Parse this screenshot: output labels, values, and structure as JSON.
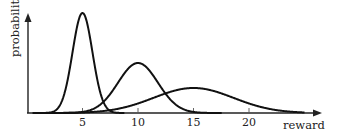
{
  "chart_data": {
    "type": "line",
    "title": "",
    "xlabel": "reward",
    "ylabel": "probability",
    "xticks": [
      5,
      10,
      15,
      20
    ],
    "xlim": [
      0,
      26
    ],
    "ylim": [
      0,
      1
    ],
    "grid": false,
    "legend": null,
    "series": [
      {
        "name": "distribution-1",
        "mean": 5,
        "sd": 0.9,
        "peak": 1.0
      },
      {
        "name": "distribution-2",
        "mean": 10,
        "sd": 1.8,
        "peak": 0.5
      },
      {
        "name": "distribution-3",
        "mean": 15,
        "sd": 3.6,
        "peak": 0.25
      }
    ]
  },
  "labels": {
    "x": "reward",
    "y": "probability",
    "ticks": [
      "5",
      "10",
      "15",
      "20"
    ]
  },
  "colors": {
    "line": "#111111",
    "axis": "#222222"
  }
}
